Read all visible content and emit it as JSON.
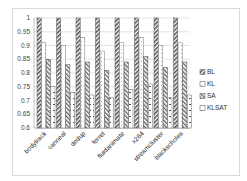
{
  "chart_data": {
    "type": "bar",
    "title": "",
    "xlabel": "",
    "ylabel": "",
    "ylim": [
      0.6,
      1.0
    ],
    "yticks": [
      "0.6",
      "0.65",
      "0.7",
      "0.75",
      "0.8",
      "0.85",
      "0.9",
      "0.95",
      "1"
    ],
    "grid": true,
    "legend_position": "right",
    "categories": [
      "bodytrack",
      "canneal",
      "dedup",
      "ferret",
      "fluidanimate",
      "x264",
      "streamcluster",
      "blackscholes"
    ],
    "series": [
      {
        "name": "BL",
        "values": [
          1.0,
          1.0,
          1.0,
          1.0,
          1.0,
          1.0,
          1.0,
          1.0
        ]
      },
      {
        "name": "KL",
        "values": [
          0.91,
          0.9,
          0.93,
          0.88,
          0.91,
          0.93,
          0.9,
          0.91
        ]
      },
      {
        "name": "SA",
        "values": [
          0.85,
          0.83,
          0.84,
          0.81,
          0.84,
          0.86,
          0.82,
          0.84
        ]
      },
      {
        "name": "KLSAT",
        "values": [
          0.75,
          0.73,
          0.72,
          0.71,
          0.74,
          0.76,
          0.71,
          0.72
        ]
      }
    ]
  },
  "legend": {
    "items": [
      {
        "label": "BL"
      },
      {
        "label": "KL"
      },
      {
        "label": "SA"
      },
      {
        "label": "KLSAT"
      }
    ]
  }
}
